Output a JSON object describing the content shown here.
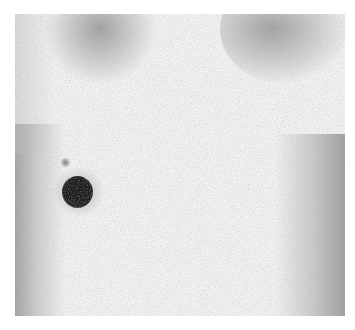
{
  "image": {
    "kind": "grayscale nuclear medicine scintigraphy scan",
    "background": "#ffffff",
    "field": "#f4f4f4",
    "regions": [
      {
        "name": "upper-left-shoulder-shadow",
        "color": "#a8a8a8"
      },
      {
        "name": "upper-right-shoulder-shadow",
        "color": "#a8a8a8"
      },
      {
        "name": "left-lateral-shadow",
        "color": "#9c9c9c"
      },
      {
        "name": "right-lateral-shadow",
        "color": "#9c9c9c"
      },
      {
        "name": "hot-spot",
        "color": "#151515"
      },
      {
        "name": "small-focus",
        "color": "#8a8a8a"
      }
    ]
  }
}
